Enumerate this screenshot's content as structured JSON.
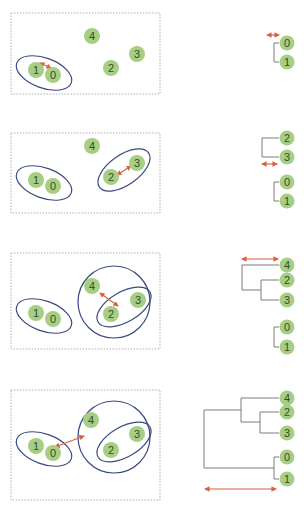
{
  "colors": {
    "node_fill": "#a6cf84",
    "node_text": "#3a4a2e",
    "cluster_outline": "#3b4a82",
    "distance_arrow": "#d9603c",
    "dendrogram_line": "#7c7c7c",
    "panel_border": "#9a9a9a"
  },
  "steps": [
    {
      "step": 1,
      "points": [
        {
          "label": "0",
          "x": 53,
          "y": 75
        },
        {
          "label": "1",
          "x": 36,
          "y": 70
        },
        {
          "label": "2",
          "x": 111,
          "y": 68
        },
        {
          "label": "3",
          "x": 137,
          "y": 54
        },
        {
          "label": "4",
          "x": 92,
          "y": 36
        }
      ],
      "merged": [
        "0",
        "1"
      ],
      "dendrogram_leaves": [
        "0",
        "1"
      ]
    },
    {
      "step": 2,
      "points": [
        {
          "label": "0",
          "x": 53,
          "y": 186
        },
        {
          "label": "1",
          "x": 36,
          "y": 180
        },
        {
          "label": "2",
          "x": 111,
          "y": 177
        },
        {
          "label": "3",
          "x": 137,
          "y": 163
        },
        {
          "label": "4",
          "x": 92,
          "y": 146
        }
      ],
      "merged": [
        "2",
        "3"
      ],
      "dendrogram_leaves": [
        "2",
        "3",
        "0",
        "1"
      ]
    },
    {
      "step": 3,
      "points": [
        {
          "label": "0",
          "x": 53,
          "y": 319
        },
        {
          "label": "1",
          "x": 36,
          "y": 313
        },
        {
          "label": "2",
          "x": 111,
          "y": 314
        },
        {
          "label": "3",
          "x": 138,
          "y": 300
        },
        {
          "label": "4",
          "x": 92,
          "y": 286
        }
      ],
      "merged": [
        "4",
        "2,3"
      ],
      "dendrogram_leaves": [
        "4",
        "2",
        "3",
        "0",
        "1"
      ]
    },
    {
      "step": 4,
      "points": [
        {
          "label": "0",
          "x": 53,
          "y": 453
        },
        {
          "label": "1",
          "x": 36,
          "y": 446
        },
        {
          "label": "2",
          "x": 111,
          "y": 450
        },
        {
          "label": "3",
          "x": 137,
          "y": 434
        },
        {
          "label": "4",
          "x": 91,
          "y": 420
        }
      ],
      "merged": [
        "0,1",
        "2,3,4"
      ],
      "dendrogram_leaves": [
        "4",
        "2",
        "3",
        "0",
        "1"
      ]
    }
  ],
  "labels": {
    "n0": "0",
    "n1": "1",
    "n2": "2",
    "n3": "3",
    "n4": "4"
  }
}
